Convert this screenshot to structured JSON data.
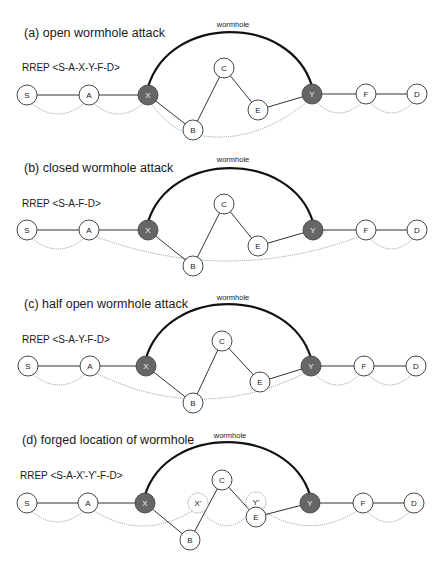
{
  "figure": {
    "colors": {
      "node_fill": "#ffffff",
      "node_stroke": "#333333",
      "malicious_fill": "#666666",
      "malicious_text": "#f0f0f0",
      "forged_stroke": "#999999",
      "route_stroke": "#8a8a8a",
      "wormhole_stroke": "#111111"
    },
    "node_radius": 10,
    "panels": [
      {
        "id": "a",
        "title": "(a) open wormhole attack",
        "title_pos": [
          24,
          37
        ],
        "rrep": "RREP <S-A-X-Y-F-D>",
        "rrep_pos": [
          22,
          71
        ],
        "wormhole_label": "wormhole",
        "wormhole_label_pos": [
          233,
          27
        ],
        "wormhole_arc": {
          "from": "X",
          "to": "Y",
          "top_y": 34
        },
        "nodes": [
          {
            "id": "S",
            "label": "S",
            "x": 27,
            "y": 95,
            "type": "normal"
          },
          {
            "id": "A",
            "label": "A",
            "x": 89,
            "y": 95,
            "type": "normal"
          },
          {
            "id": "X",
            "label": "X",
            "x": 148,
            "y": 95,
            "type": "malicious"
          },
          {
            "id": "C",
            "label": "C",
            "x": 224,
            "y": 68,
            "type": "normal"
          },
          {
            "id": "E",
            "label": "E",
            "x": 258,
            "y": 110,
            "type": "normal"
          },
          {
            "id": "B",
            "label": "B",
            "x": 193,
            "y": 130,
            "type": "normal"
          },
          {
            "id": "Y",
            "label": "Y",
            "x": 312,
            "y": 94,
            "type": "malicious"
          },
          {
            "id": "F",
            "label": "F",
            "x": 366,
            "y": 94,
            "type": "normal"
          },
          {
            "id": "D",
            "label": "D",
            "x": 417,
            "y": 94,
            "type": "normal"
          }
        ],
        "edges": [
          [
            "S",
            "A"
          ],
          [
            "A",
            "X"
          ],
          [
            "X",
            "B"
          ],
          [
            "B",
            "C"
          ],
          [
            "C",
            "E"
          ],
          [
            "E",
            "Y"
          ],
          [
            "Y",
            "F"
          ],
          [
            "F",
            "D"
          ]
        ],
        "routes": [
          {
            "from": "S",
            "to": "A",
            "dip": 22
          },
          {
            "from": "A",
            "to": "X",
            "dip": 22
          },
          {
            "from": "X",
            "to": "B",
            "dip": 6
          },
          {
            "from": "B",
            "to": "Y",
            "dip": 14
          },
          {
            "from": "Y",
            "to": "F",
            "dip": 22
          },
          {
            "from": "F",
            "to": "D",
            "dip": 22
          }
        ]
      },
      {
        "id": "b",
        "title": "(b) closed wormhole attack",
        "title_pos": [
          24,
          172
        ],
        "rrep": "RREP <S-A-F-D>",
        "rrep_pos": [
          22,
          207
        ],
        "wormhole_label": "wormhole",
        "wormhole_label_pos": [
          233,
          162
        ],
        "wormhole_arc": {
          "from": "X",
          "to": "Y",
          "top_y": 170
        },
        "nodes": [
          {
            "id": "S",
            "label": "S",
            "x": 27,
            "y": 230,
            "type": "normal"
          },
          {
            "id": "A",
            "label": "A",
            "x": 89,
            "y": 230,
            "type": "normal"
          },
          {
            "id": "X",
            "label": "X",
            "x": 148,
            "y": 230,
            "type": "malicious"
          },
          {
            "id": "C",
            "label": "C",
            "x": 224,
            "y": 204,
            "type": "normal"
          },
          {
            "id": "E",
            "label": "E",
            "x": 258,
            "y": 246,
            "type": "normal"
          },
          {
            "id": "B",
            "label": "B",
            "x": 193,
            "y": 266,
            "type": "normal"
          },
          {
            "id": "Y",
            "label": "Y",
            "x": 313,
            "y": 230,
            "type": "malicious"
          },
          {
            "id": "F",
            "label": "F",
            "x": 366,
            "y": 230,
            "type": "normal"
          },
          {
            "id": "D",
            "label": "D",
            "x": 417,
            "y": 230,
            "type": "normal"
          }
        ],
        "edges": [
          [
            "S",
            "A"
          ],
          [
            "A",
            "X"
          ],
          [
            "X",
            "B"
          ],
          [
            "B",
            "C"
          ],
          [
            "C",
            "E"
          ],
          [
            "E",
            "Y"
          ],
          [
            "Y",
            "F"
          ],
          [
            "F",
            "D"
          ]
        ],
        "routes": [
          {
            "from": "S",
            "to": "A",
            "dip": 22
          },
          {
            "from": "A",
            "to": "F",
            "dip": 34
          },
          {
            "from": "F",
            "to": "D",
            "dip": 22
          }
        ]
      },
      {
        "id": "c",
        "title": "(c) half open wormhole attack",
        "title_pos": [
          24,
          308
        ],
        "rrep": "RREP <S-A-Y-F-D>",
        "rrep_pos": [
          22,
          343
        ],
        "wormhole_label": "wormhole",
        "wormhole_label_pos": [
          233,
          300
        ],
        "wormhole_arc": {
          "from": "X",
          "to": "Y",
          "top_y": 306
        },
        "nodes": [
          {
            "id": "S",
            "label": "S",
            "x": 28,
            "y": 366,
            "type": "normal"
          },
          {
            "id": "A",
            "label": "A",
            "x": 90,
            "y": 366,
            "type": "normal"
          },
          {
            "id": "X",
            "label": "X",
            "x": 146,
            "y": 366,
            "type": "malicious"
          },
          {
            "id": "C",
            "label": "C",
            "x": 222,
            "y": 341,
            "type": "normal"
          },
          {
            "id": "E",
            "label": "E",
            "x": 260,
            "y": 382,
            "type": "normal"
          },
          {
            "id": "B",
            "label": "B",
            "x": 193,
            "y": 403,
            "type": "normal"
          },
          {
            "id": "Y",
            "label": "Y",
            "x": 311,
            "y": 366,
            "type": "malicious"
          },
          {
            "id": "F",
            "label": "F",
            "x": 364,
            "y": 366,
            "type": "normal"
          },
          {
            "id": "D",
            "label": "D",
            "x": 416,
            "y": 366,
            "type": "normal"
          }
        ],
        "edges": [
          [
            "S",
            "A"
          ],
          [
            "A",
            "X"
          ],
          [
            "X",
            "B"
          ],
          [
            "B",
            "C"
          ],
          [
            "C",
            "E"
          ],
          [
            "E",
            "Y"
          ],
          [
            "Y",
            "F"
          ],
          [
            "F",
            "D"
          ]
        ],
        "routes": [
          {
            "from": "S",
            "to": "A",
            "dip": 22
          },
          {
            "from": "A",
            "to": "Y",
            "dip": 36
          },
          {
            "from": "Y",
            "to": "F",
            "dip": 22
          },
          {
            "from": "F",
            "to": "D",
            "dip": 22
          }
        ]
      },
      {
        "id": "d",
        "title": "(d) forged location of wormhole",
        "title_pos": [
          22,
          444
        ],
        "rrep": "RREP <S-A-X'-Y'-F-D>",
        "rrep_pos": [
          20,
          479
        ],
        "wormhole_label": "wormhole",
        "wormhole_label_pos": [
          230,
          438
        ],
        "wormhole_arc": {
          "from": "X",
          "to": "Y",
          "top_y": 444
        },
        "nodes": [
          {
            "id": "S",
            "label": "S",
            "x": 27,
            "y": 503,
            "type": "normal"
          },
          {
            "id": "A",
            "label": "A",
            "x": 88,
            "y": 503,
            "type": "normal"
          },
          {
            "id": "X",
            "label": "X",
            "x": 145,
            "y": 503,
            "type": "malicious"
          },
          {
            "id": "Xp",
            "label": "X'",
            "x": 198,
            "y": 503,
            "type": "forged"
          },
          {
            "id": "C",
            "label": "C",
            "x": 222,
            "y": 480,
            "type": "normal"
          },
          {
            "id": "Yp",
            "label": "Y'",
            "x": 256,
            "y": 502,
            "type": "forged"
          },
          {
            "id": "E",
            "label": "E",
            "x": 256,
            "y": 517,
            "type": "normal"
          },
          {
            "id": "B",
            "label": "B",
            "x": 190,
            "y": 540,
            "type": "normal"
          },
          {
            "id": "Y",
            "label": "Y",
            "x": 310,
            "y": 503,
            "type": "malicious"
          },
          {
            "id": "F",
            "label": "F",
            "x": 363,
            "y": 503,
            "type": "normal"
          },
          {
            "id": "D",
            "label": "D",
            "x": 414,
            "y": 503,
            "type": "normal"
          }
        ],
        "edges": [
          [
            "S",
            "A"
          ],
          [
            "A",
            "X"
          ],
          [
            "X",
            "B"
          ],
          [
            "B",
            "C"
          ],
          [
            "C",
            "E"
          ],
          [
            "E",
            "Y"
          ],
          [
            "Y",
            "F"
          ],
          [
            "F",
            "D"
          ]
        ],
        "routes": [
          {
            "from": "S",
            "to": "A",
            "dip": 22
          },
          {
            "from": "A",
            "to": "Xp",
            "dip": 26
          },
          {
            "from": "Xp",
            "to": "Yp",
            "dip": 26
          },
          {
            "from": "Yp",
            "to": "F",
            "dip": 26
          },
          {
            "from": "F",
            "to": "D",
            "dip": 22
          }
        ]
      }
    ]
  }
}
